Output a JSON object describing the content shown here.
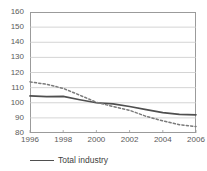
{
  "chart_data": {
    "type": "line",
    "title": "",
    "xlabel": "",
    "ylabel": "",
    "xlim": [
      1996,
      2006
    ],
    "ylim": [
      80,
      160
    ],
    "grid": true,
    "legend_position": "bottom-left",
    "xticks": [
      "1996",
      "1998",
      "2000",
      "2002",
      "2004",
      "2006"
    ],
    "xtick_values": [
      1996,
      1998,
      2000,
      2002,
      2004,
      2006
    ],
    "yticks": [
      "80",
      "90",
      "100",
      "110",
      "120",
      "130",
      "140",
      "150",
      "160"
    ],
    "ytick_values": [
      80,
      90,
      100,
      110,
      120,
      130,
      140,
      150,
      160
    ],
    "x": [
      1996,
      1997,
      1998,
      1999,
      2000,
      2001,
      2002,
      2003,
      2004,
      2005,
      2006
    ],
    "series": [
      {
        "name": "Total industry",
        "style": "solid",
        "color": "#4f4f4f",
        "values": [
          104.5,
          104.0,
          104.2,
          102.0,
          100.0,
          99.3,
          97.5,
          95.5,
          93.5,
          92.3,
          92.0
        ]
      },
      {
        "name": "",
        "style": "dotted",
        "color": "#7a7a7a",
        "values": [
          113.8,
          112.2,
          109.5,
          105.0,
          100.3,
          97.5,
          95.0,
          91.0,
          88.0,
          85.5,
          84.3
        ]
      }
    ]
  },
  "legend": {
    "items": [
      {
        "label": "Total industry",
        "style": "solid",
        "color": "#4f4f4f"
      }
    ]
  },
  "axes": {
    "y_axis_name": "index-value-axis",
    "x_axis_name": "year-axis"
  }
}
